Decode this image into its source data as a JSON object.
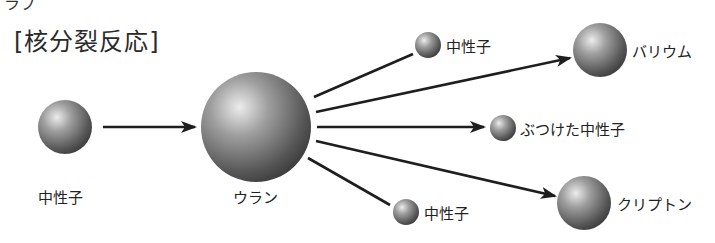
{
  "title": "[核分裂反応]",
  "top_fragment": "ラブ",
  "nodes": {
    "incoming_neutron": {
      "label": "中性子"
    },
    "uranium": {
      "label": "ウラン"
    },
    "released_neutron_top": {
      "label": "中性子"
    },
    "barium": {
      "label": "バリウム"
    },
    "hit_neutron": {
      "label": "ぶつけた中性子"
    },
    "krypton": {
      "label": "クリプトン"
    },
    "released_neutron_bottom": {
      "label": "中性子"
    }
  },
  "colors": {
    "sphere_highlight": "#e6e6e6",
    "sphere_mid": "#8c8c8c",
    "sphere_shadow": "#3a3a3a",
    "line": "#1e1e1e"
  }
}
